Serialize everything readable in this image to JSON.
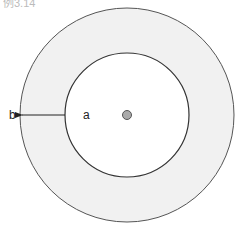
{
  "caption": "例3.14",
  "diagram": {
    "outer_radius_label": "b",
    "inner_radius_label": "a",
    "colors": {
      "annulus_fill": "#f1f1f1",
      "inner_fill": "#ffffff",
      "stroke": "#333333",
      "center_dot": "#aaaaaa"
    }
  }
}
